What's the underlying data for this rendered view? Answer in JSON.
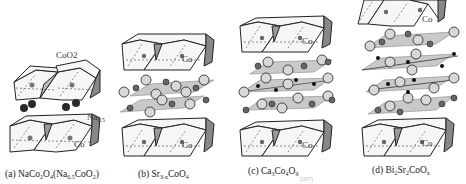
{
  "figure": {
    "panels": [
      {
        "id": "a",
        "label_prefix": "(a)",
        "formula_main": "NaCo",
        "formula_parts": [
          "NaCo",
          "2",
          "O",
          "4",
          "(Na",
          "0.5",
          "CoO",
          "2",
          ")"
        ],
        "atom_labels": {
          "layer": "CoO2",
          "ion": "Na0.5",
          "center": "Co"
        }
      },
      {
        "id": "b",
        "label_prefix": "(b)",
        "formula_parts": [
          "Sr",
          "3-x",
          "CoO",
          "4"
        ],
        "atom_labels": {
          "center": "Co"
        }
      },
      {
        "id": "c",
        "label_prefix": "(c)",
        "formula_parts": [
          "Ca",
          "3",
          "Co",
          "4",
          "O",
          "9"
        ],
        "atom_labels": {
          "center": "Co"
        }
      },
      {
        "id": "d",
        "label_prefix": "(d)",
        "formula_parts": [
          "Bi",
          "2",
          "Sr",
          "2",
          "CoO",
          "x"
        ],
        "atom_labels": {
          "center": "Co"
        }
      }
    ],
    "faint_caption": "[207]",
    "colors": {
      "octahedron_face": "#f4f4f4",
      "octahedron_shade": "#8a8a8a",
      "plane": "#c9c9c9",
      "atom_large": "#d6d6d6",
      "atom_small": "#6a6a6a",
      "atom_dark": "#1a1a1a",
      "na_atom": "#333333"
    }
  }
}
